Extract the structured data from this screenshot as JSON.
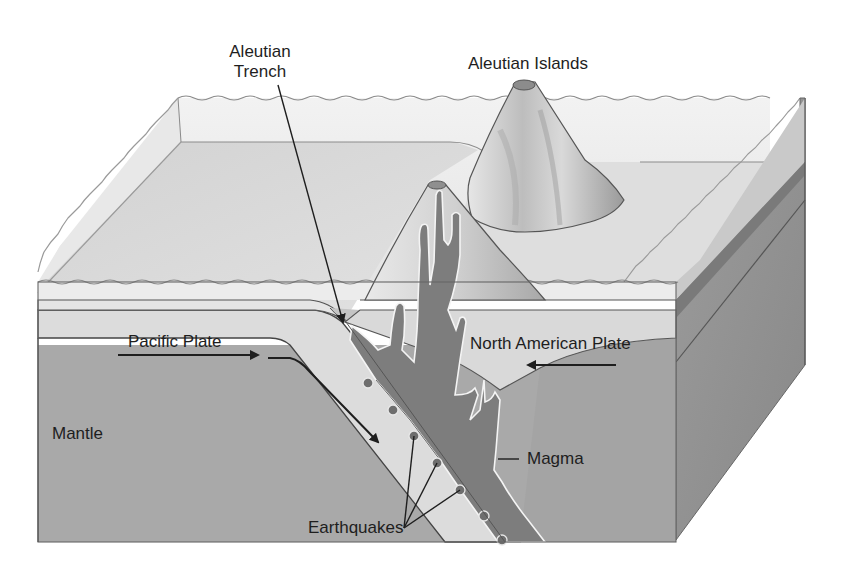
{
  "diagram": {
    "type": "block-diagram-cross-section",
    "labels": {
      "aleutian_trench_line1": "Aleutian",
      "aleutian_trench_line2": "Trench",
      "aleutian_islands": "Aleutian Islands",
      "pacific_plate": "Pacific Plate",
      "north_american_plate": "North American Plate",
      "mantle": "Mantle",
      "magma": "Magma",
      "earthquakes": "Earthquakes"
    },
    "arrows": [
      {
        "name": "pacific-plate-direction",
        "direction": "right",
        "from": "Pacific Plate"
      },
      {
        "name": "subduction-direction",
        "direction": "down-right",
        "along": "subducting slab"
      },
      {
        "name": "north-american-plate-direction",
        "direction": "left",
        "from": "North American Plate"
      }
    ],
    "earthquake_points": [
      {
        "x": 368,
        "y": 383
      },
      {
        "x": 393,
        "y": 410
      },
      {
        "x": 414,
        "y": 436
      },
      {
        "x": 437,
        "y": 463
      },
      {
        "x": 460,
        "y": 490
      },
      {
        "x": 484,
        "y": 516
      },
      {
        "x": 502,
        "y": 540
      }
    ],
    "colors": {
      "water": "#ebebeb",
      "seafloor": "#d6d6d6",
      "plate": "#dcdcdc",
      "mantle": "#a9a9a9",
      "mantle_side": "#8f8f8f",
      "magma": "#7d7d7d",
      "volcano": "#c8c8c8",
      "outline": "#555555",
      "text": "#1e1e1e",
      "earthquake_dot": "#6e6e6e"
    }
  }
}
